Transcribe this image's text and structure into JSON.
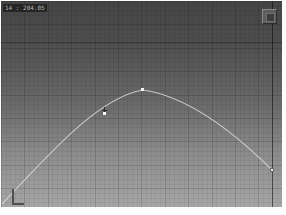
{
  "viewport": {
    "description": "3d-perspective-grid-viewport",
    "background_top": "#454545",
    "background_bottom": "#a6a6a6",
    "grid_line_color": "rgba(0,0,0,0.08)",
    "axis_line_color": "#1a1a1a"
  },
  "readout": {
    "text": "14 : 204.05"
  },
  "corner_button": {
    "label": ""
  },
  "curve": {
    "type": "trajectory-arc",
    "color": "#d9d9d9",
    "apex": {
      "x": 142,
      "y": 89
    },
    "start": {
      "x": 2,
      "y": 202
    },
    "end": {
      "x": 272,
      "y": 170
    }
  },
  "markers": {
    "apex_key": "white-dot",
    "end_handle": "white-square"
  }
}
